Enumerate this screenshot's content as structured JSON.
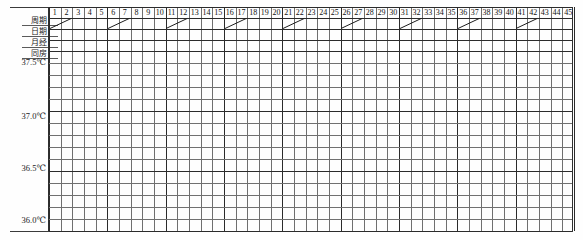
{
  "chart_data": {
    "type": "table",
    "title": "",
    "xlabel": "",
    "ylabel": "",
    "ylim": [
      36.0,
      37.5
    ],
    "grid": true,
    "legend": "none",
    "columns": [
      1,
      2,
      3,
      4,
      5,
      6,
      7,
      8,
      9,
      10,
      11,
      12,
      13,
      14,
      15,
      16,
      17,
      18,
      19,
      20,
      21,
      22,
      23,
      24,
      25,
      26,
      27,
      28,
      29,
      30,
      31,
      32,
      33,
      34,
      35,
      36,
      37,
      38,
      39,
      40,
      41,
      42,
      43,
      44,
      45
    ],
    "column_count": 45,
    "header_rows": [
      {
        "label": "周期",
        "kind": "numbers"
      },
      {
        "label": "日期",
        "kind": "slashes"
      },
      {
        "label": "月经",
        "kind": "blank"
      },
      {
        "label": "同房",
        "kind": "blank"
      }
    ],
    "slash_columns": [
      1,
      6,
      11,
      16,
      21,
      26,
      31,
      36,
      41
    ],
    "y_tick_labels": [
      "37.5℃",
      "37.0℃",
      "36.5℃",
      "36.0℃"
    ],
    "y_tick_values": [
      37.5,
      37.0,
      36.5,
      36.0
    ],
    "minor_rows_per_major": 5,
    "total_temperature_rows": 15,
    "series": [
      {
        "name": "体温",
        "values": []
      }
    ]
  },
  "colors": {
    "grid_minor": "#707070",
    "grid_major": "#2b2b2b",
    "text": "#111111",
    "background": "#ffffff"
  }
}
